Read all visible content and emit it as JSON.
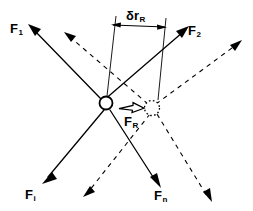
{
  "figure": {
    "type": "force-diagram",
    "background_color": "#ffffff",
    "line_color": "#000000"
  },
  "labels": {
    "force_1": {
      "base": "F",
      "sub": "1"
    },
    "force_2": {
      "base": "F",
      "sub": "2"
    },
    "force_i": {
      "base": "F",
      "sub": "i"
    },
    "force_n": {
      "base": "F",
      "sub": "n"
    },
    "force_R": {
      "base": "F",
      "sub": "R"
    },
    "displacement": {
      "base": "δr",
      "sub": "R"
    }
  },
  "nodes": {
    "original_particle": {
      "cx": 106,
      "cy": 103,
      "r": 6.5,
      "style": "solid"
    },
    "displaced_particle": {
      "cx": 152,
      "cy": 108,
      "r": 7.5,
      "style": "dotted"
    }
  },
  "dimension": {
    "left_extension": {
      "x1": 116,
      "y1": 16,
      "x2": 107,
      "y2": 96
    },
    "right_extension": {
      "x1": 166,
      "y1": 18,
      "x2": 158,
      "y2": 100
    },
    "dim_line": {
      "x1": 112,
      "y1": 25,
      "x2": 166,
      "y2": 27
    }
  },
  "solid_forces": [
    {
      "name": "F1",
      "x1": 29,
      "y1": 25,
      "x2": 101,
      "y2": 99
    },
    {
      "name": "F2",
      "x1": 103,
      "y1": 101,
      "x2": 187,
      "y2": 28
    },
    {
      "name": "Fi",
      "x1": 104,
      "y1": 110,
      "x2": 44,
      "y2": 182
    },
    {
      "name": "Fn",
      "x1": 110,
      "y1": 110,
      "x2": 158,
      "y2": 185
    }
  ],
  "dashed_forces": [
    {
      "name": "F1-shifted",
      "x1": 148,
      "y1": 104,
      "x2": 66,
      "y2": 33
    },
    {
      "name": "F2-shifted",
      "x1": 156,
      "y1": 104,
      "x2": 240,
      "y2": 42
    },
    {
      "name": "Fi-shifted",
      "x1": 150,
      "y1": 114,
      "x2": 85,
      "y2": 195
    },
    {
      "name": "Fn-shifted",
      "x1": 157,
      "y1": 114,
      "x2": 210,
      "y2": 200
    }
  ],
  "resultant_arrow": {
    "x1": 120,
    "y1": 106,
    "x2": 143,
    "y2": 109
  }
}
